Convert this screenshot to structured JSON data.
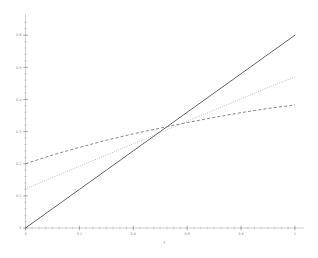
{
  "figure": {
    "background": "#ffffff",
    "axis_color": "#9a9a9a",
    "tick_label_color": "#8a8a8a"
  },
  "chart_data": {
    "type": "line",
    "title": "",
    "subtitle": "",
    "xlabel": "t",
    "ylabel": "",
    "xlim": [
      0,
      1.03
    ],
    "ylim": [
      0,
      0.655
    ],
    "grid": false,
    "legend": "none",
    "x_ticks_major": [
      0,
      0.2,
      0.4,
      0.6,
      0.8,
      1
    ],
    "x_tick_labels": [
      "0",
      "0.2",
      "0.4",
      "0.6",
      "0.8",
      "1"
    ],
    "x_minor_tick_step": 0.025,
    "y_ticks_major": [
      0,
      0.1,
      0.2,
      0.3,
      0.4,
      0.5,
      0.6
    ],
    "y_tick_labels": [
      "0",
      "0.1",
      "0.2",
      "0.3",
      "0.4",
      "0.5",
      "0.6"
    ],
    "y_labeled_ticks": [
      0,
      0.1,
      0.2,
      0.3,
      0.4,
      0.5,
      0.6
    ],
    "y_minor_tick_step": 0.02,
    "intersection_point": [
      0.55,
      0.33
    ],
    "series": [
      {
        "name": "solid",
        "style": "solid",
        "color": "#555555",
        "width": 0.9,
        "x": [
          0,
          0.1,
          0.2,
          0.3,
          0.4,
          0.5,
          0.6,
          0.7,
          0.8,
          0.9,
          1
        ],
        "values": [
          0.0,
          0.06,
          0.12,
          0.18,
          0.24,
          0.3,
          0.36,
          0.42,
          0.48,
          0.54,
          0.6
        ]
      },
      {
        "name": "dotted",
        "style": "dotted",
        "color": "#8e8e8e",
        "width": 0.9,
        "x": [
          0,
          0.1,
          0.2,
          0.3,
          0.4,
          0.5,
          0.6,
          0.7,
          0.8,
          0.9,
          1
        ],
        "values": [
          0.122,
          0.157,
          0.192,
          0.227,
          0.262,
          0.297,
          0.332,
          0.367,
          0.402,
          0.437,
          0.47
        ]
      },
      {
        "name": "dashed",
        "style": "dashed",
        "color": "#7d7d7d",
        "width": 0.9,
        "x": [
          0,
          0.1,
          0.2,
          0.3,
          0.4,
          0.5,
          0.6,
          0.7,
          0.8,
          0.9,
          1
        ],
        "values": [
          0.2,
          0.227,
          0.251,
          0.273,
          0.293,
          0.311,
          0.328,
          0.344,
          0.359,
          0.372,
          0.383
        ]
      }
    ]
  }
}
